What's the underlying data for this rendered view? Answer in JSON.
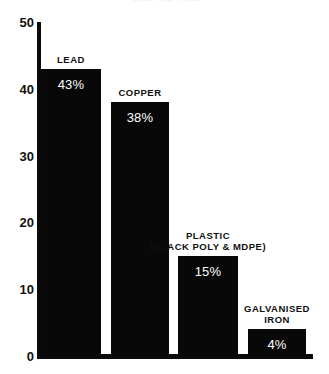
{
  "chart_data": {
    "type": "bar",
    "title": "",
    "xlabel": "",
    "ylabel": "",
    "ylim": [
      0,
      50
    ],
    "ytick_labels": [
      "50",
      "40",
      "30",
      "20",
      "10",
      "0"
    ],
    "yticks": [
      50,
      40,
      30,
      20,
      10,
      0
    ],
    "grid": false,
    "legend": "none",
    "categories": [
      "LEAD",
      "COPPER",
      "PLASTIC (BLACK POLY & MDPE)",
      "GALVANISED IRON"
    ],
    "values": [
      43,
      38,
      15,
      4
    ],
    "bars": [
      {
        "label_line1": "LEAD",
        "label_line2": "",
        "value": 43,
        "value_label": "43%"
      },
      {
        "label_line1": "COPPER",
        "label_line2": "",
        "value": 38,
        "value_label": "38%"
      },
      {
        "label_line1": "PLASTIC",
        "label_line2": "(BLACK POLY & MDPE)",
        "value": 15,
        "value_label": "15%"
      },
      {
        "label_line1": "GALVANISED",
        "label_line2": "IRON",
        "value": 4,
        "value_label": "4%"
      }
    ],
    "colors": {
      "bar": "#080808",
      "axis": "#0b0b0b",
      "background": "#ffffff",
      "value_text": "#ffffff",
      "label_text": "#101010"
    }
  },
  "title_sliver": "CROPPED TITLE"
}
